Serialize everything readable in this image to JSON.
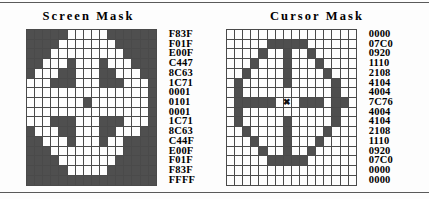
{
  "panels": [
    {
      "title": "Screen Mask",
      "name": "screen-mask",
      "rows": [
        "F83F",
        "F01F",
        "E00F",
        "C447",
        "8C63",
        "1C71",
        "0001",
        "0101",
        "0001",
        "1C71",
        "8C63",
        "C44F",
        "E00F",
        "F01F",
        "F83F",
        "FFFF"
      ],
      "hotspot": null
    },
    {
      "title": "Cursor Mask",
      "name": "cursor-mask",
      "rows": [
        "0000",
        "07C0",
        "0920",
        "1110",
        "2108",
        "4104",
        "4004",
        "7C76",
        "4004",
        "4104",
        "2108",
        "1110",
        "0920",
        "07C0",
        "0000",
        "0000"
      ],
      "hotspot": {
        "row": 7,
        "col": 7,
        "glyph": "✖"
      }
    }
  ],
  "colors": {
    "bit_on": "#4f4f4f",
    "bit_off": "#fdfdfd",
    "grid_line": "#4a4a4a",
    "rule": "#5a5a5a",
    "text": "#000000"
  }
}
